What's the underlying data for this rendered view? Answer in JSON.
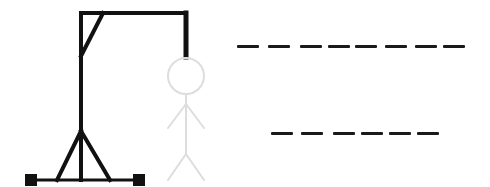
{
  "game": {
    "title": "Hangman",
    "colors": {
      "gallows": "#111111",
      "figure_faded": "#dddddd",
      "slots": "#1a1a1a",
      "background": "#ffffff"
    },
    "figure_state": "faded",
    "words": [
      {
        "name": "word-1",
        "letter_count": 8,
        "revealed": [
          "",
          "",
          "",
          "",
          "",
          "",
          "",
          ""
        ],
        "slots_x": [
          237,
          268,
          300,
          328,
          355,
          385,
          415,
          443
        ],
        "y": 45
      },
      {
        "name": "word-2",
        "letter_count": 6,
        "revealed": [
          "",
          "",
          "",
          "",
          "",
          ""
        ],
        "slots_x": [
          271,
          301,
          333,
          361,
          389,
          417
        ],
        "y": 132
      }
    ]
  }
}
